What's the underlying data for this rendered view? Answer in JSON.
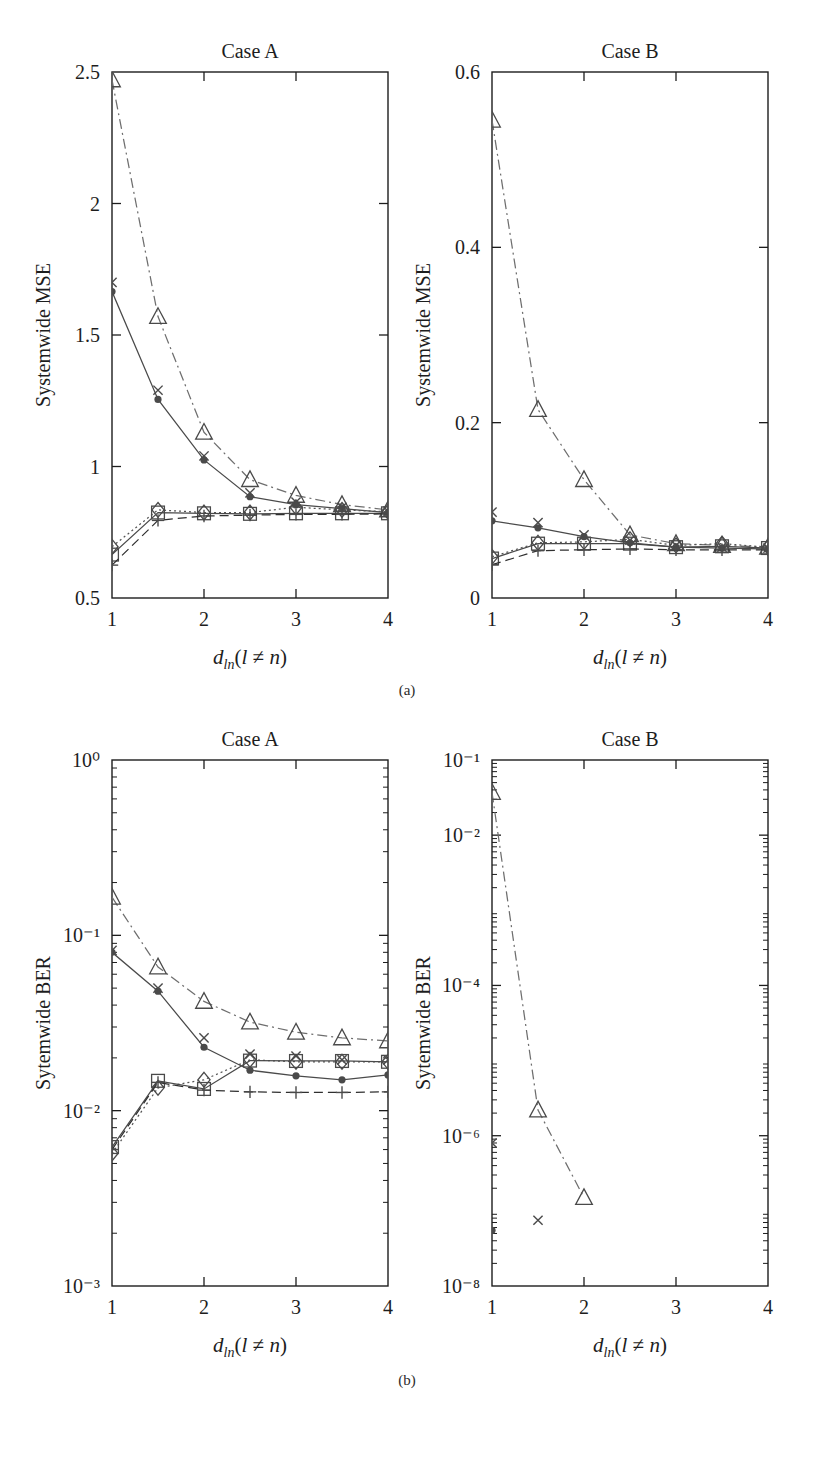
{
  "figure": {
    "subcaption_a": "(a)",
    "subcaption_b": "(b)",
    "caption": "",
    "colors": {
      "axis": "#1d1d1d",
      "curve_solid": "#4a4a4a",
      "curve_dashdot": "#6e6e6e",
      "curve_dashed": "#2f2f2f",
      "curve_dotted": "#555555",
      "marker": "#4a4a4a",
      "text": "#1d1d1d"
    }
  },
  "chart_data": [
    {
      "id": "a-caseA",
      "type": "line",
      "title": "Case A",
      "xlabel": "d_ln(l ≠ n)",
      "ylabel": "Systemwide MSE",
      "xscale": "linear",
      "yscale": "linear",
      "xlim": [
        1,
        4
      ],
      "ylim": [
        0.5,
        2.5
      ],
      "xticks": [
        1,
        2,
        3,
        4
      ],
      "xtick_labels": [
        "1",
        "2",
        "3",
        "4"
      ],
      "yticks": [
        0.5,
        1,
        1.5,
        2,
        2.5
      ],
      "ytick_labels": [
        "0.5",
        "1",
        "1.5",
        "2",
        "2.5"
      ],
      "grid": false,
      "legend": "none",
      "x": [
        1,
        1.5,
        2,
        2.5,
        3,
        3.5,
        4
      ],
      "series": [
        {
          "name": "triangle-dashdot",
          "marker": "triangle",
          "line": "dashdot",
          "values": [
            2.47,
            1.57,
            1.13,
            0.95,
            0.89,
            0.855,
            0.835
          ]
        },
        {
          "name": "cross-solid",
          "marker": "cross",
          "line": "none",
          "values": [
            1.7,
            1.29,
            1.04,
            0.9,
            0.865,
            0.845,
            0.83
          ]
        },
        {
          "name": "dot-solid",
          "marker": "dot",
          "line": "solid",
          "values": [
            1.665,
            1.255,
            1.025,
            0.885,
            0.855,
            0.84,
            0.825
          ]
        },
        {
          "name": "diamond-dotted",
          "marker": "diamond",
          "line": "dotted",
          "values": [
            0.695,
            0.835,
            0.825,
            0.825,
            0.845,
            0.835,
            0.828
          ]
        },
        {
          "name": "square-solid",
          "marker": "square",
          "line": "solid",
          "values": [
            0.665,
            0.825,
            0.822,
            0.82,
            0.822,
            0.822,
            0.822
          ]
        },
        {
          "name": "plus-dashed",
          "marker": "plus",
          "line": "dashed",
          "values": [
            0.625,
            0.795,
            0.812,
            0.815,
            0.818,
            0.818,
            0.82
          ]
        }
      ]
    },
    {
      "id": "a-caseB",
      "type": "line",
      "title": "Case B",
      "xlabel": "d_ln(l ≠ n)",
      "ylabel": "Systemwide MSE",
      "xscale": "linear",
      "yscale": "linear",
      "xlim": [
        1,
        4
      ],
      "ylim": [
        0,
        0.6
      ],
      "xticks": [
        1,
        2,
        3,
        4
      ],
      "xtick_labels": [
        "1",
        "2",
        "3",
        "4"
      ],
      "yticks": [
        0,
        0.2,
        0.4,
        0.6
      ],
      "ytick_labels": [
        "0",
        "0.2",
        "0.4",
        "0.6"
      ],
      "grid": false,
      "legend": "none",
      "x": [
        1,
        1.5,
        2,
        2.5,
        3,
        3.5,
        4
      ],
      "series": [
        {
          "name": "triangle-dashdot",
          "marker": "triangle",
          "line": "dashdot",
          "values": [
            0.545,
            0.215,
            0.135,
            0.072,
            0.062,
            0.06,
            0.058
          ]
        },
        {
          "name": "cross-solid",
          "marker": "cross",
          "line": "none",
          "values": [
            0.098,
            0.086,
            0.072,
            0.066,
            0.06,
            0.058,
            0.057
          ]
        },
        {
          "name": "dot-solid",
          "marker": "dot",
          "line": "solid",
          "values": [
            0.088,
            0.08,
            0.07,
            0.063,
            0.058,
            0.057,
            0.056
          ]
        },
        {
          "name": "diamond-dotted",
          "marker": "diamond",
          "line": "dotted",
          "values": [
            0.047,
            0.063,
            0.064,
            0.067,
            0.06,
            0.062,
            0.058
          ]
        },
        {
          "name": "square-solid",
          "marker": "square",
          "line": "solid",
          "values": [
            0.045,
            0.062,
            0.062,
            0.062,
            0.058,
            0.059,
            0.057
          ]
        },
        {
          "name": "plus-dashed",
          "marker": "plus",
          "line": "dashed",
          "values": [
            0.038,
            0.054,
            0.055,
            0.056,
            0.055,
            0.055,
            0.055
          ]
        }
      ]
    },
    {
      "id": "b-caseA",
      "type": "line",
      "title": "Case A",
      "xlabel": "d_ln(l ≠ n)",
      "ylabel": "Sytemwide BER",
      "xscale": "linear",
      "yscale": "log",
      "xlim": [
        1,
        4
      ],
      "ylim": [
        0.001,
        1
      ],
      "xticks": [
        1,
        2,
        3,
        4
      ],
      "xtick_labels": [
        "1",
        "2",
        "3",
        "4"
      ],
      "yticks": [
        0.001,
        0.01,
        0.1,
        1
      ],
      "ytick_labels": [
        "10⁻³",
        "10⁻²",
        "10⁻¹",
        "10⁰"
      ],
      "grid": false,
      "legend": "none",
      "x": [
        1,
        1.5,
        2,
        2.5,
        3,
        3.5,
        4
      ],
      "series": [
        {
          "name": "triangle-dashdot",
          "marker": "triangle",
          "line": "dashdot",
          "values": [
            0.165,
            0.066,
            0.042,
            0.032,
            0.028,
            0.026,
            0.025
          ]
        },
        {
          "name": "cross-solid",
          "marker": "cross",
          "line": "none",
          "values": [
            0.082,
            0.05,
            0.026,
            0.021,
            0.0205,
            0.0195,
            0.0195
          ]
        },
        {
          "name": "dot-solid",
          "marker": "dot",
          "line": "solid",
          "values": [
            0.08,
            0.048,
            0.023,
            0.017,
            0.0158,
            0.015,
            0.016
          ]
        },
        {
          "name": "diamond-dotted",
          "marker": "diamond",
          "line": "dotted",
          "values": [
            0.0057,
            0.0135,
            0.015,
            0.0195,
            0.019,
            0.019,
            0.019
          ]
        },
        {
          "name": "square-solid",
          "marker": "square",
          "line": "solid",
          "values": [
            0.0062,
            0.0148,
            0.0133,
            0.0193,
            0.0192,
            0.0192,
            0.019
          ]
        },
        {
          "name": "plus-dashed",
          "marker": "plus",
          "line": "dashed",
          "values": [
            0.006,
            0.0145,
            0.0131,
            0.0128,
            0.0127,
            0.0127,
            0.0128
          ]
        }
      ]
    },
    {
      "id": "b-caseB",
      "type": "line",
      "title": "Case B",
      "xlabel": "d_ln(l ≠ n)",
      "ylabel": "Sytemwide BER",
      "xscale": "linear",
      "yscale": "log",
      "xlim": [
        1,
        4
      ],
      "ylim": [
        1e-08,
        0.1
      ],
      "xticks": [
        1,
        2,
        3,
        4
      ],
      "xtick_labels": [
        "1",
        "2",
        "3",
        "4"
      ],
      "yticks": [
        1e-08,
        1e-06,
        0.0001,
        0.01,
        0.1
      ],
      "ytick_labels": [
        "10⁻⁸",
        "10⁻⁶",
        "10⁻⁴",
        "10⁻²",
        "10⁻¹"
      ],
      "grid": false,
      "legend": "none",
      "x": [
        1,
        1.5,
        2
      ],
      "series": [
        {
          "name": "triangle-dashdot",
          "marker": "triangle",
          "line": "dashdot",
          "values": [
            0.037,
            2.2e-06,
            1.5e-07
          ]
        },
        {
          "name": "cross-solid",
          "marker": "cross",
          "line": "none",
          "values": [
            8e-07,
            7.5e-08,
            null
          ]
        },
        {
          "name": "dot-solid",
          "marker": "dot",
          "line": "none",
          "values": [
            5.5e-08,
            null,
            null
          ]
        }
      ]
    }
  ]
}
